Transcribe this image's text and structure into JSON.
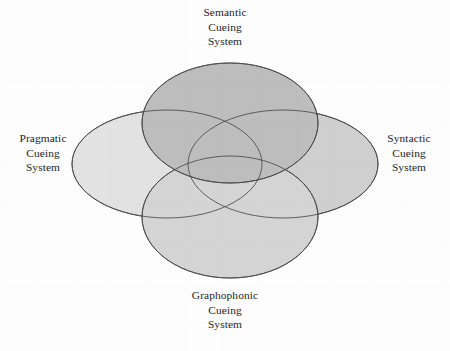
{
  "diagram": {
    "type": "venn",
    "background_color": "#fdfdfd",
    "stroke_color": "#4a4a4a",
    "sets": [
      {
        "id": "semantic",
        "label_lines": [
          "Semantic",
          "Cueing",
          "System"
        ],
        "label_line_1": "Semantic",
        "label_line_2": "Cueing",
        "label_line_3": "System",
        "position": "top",
        "fill_color": "#a9a9a9",
        "ellipse": {
          "cx": 230,
          "cy": 123,
          "rx": 88,
          "ry": 60
        }
      },
      {
        "id": "pragmatic",
        "label_lines": [
          "Pragmatic",
          "Cueing",
          "System"
        ],
        "label_line_1": "Pragmatic",
        "label_line_2": "Cueing",
        "label_line_3": "System",
        "position": "left",
        "fill_color": "#e2e2e2",
        "ellipse": {
          "cx": 167,
          "cy": 164,
          "rx": 95,
          "ry": 54
        }
      },
      {
        "id": "syntactic",
        "label_lines": [
          "Syntactic",
          "Cueing",
          "System"
        ],
        "label_line_1": "Syntactic",
        "label_line_2": "Cueing",
        "label_line_3": "System",
        "position": "right",
        "fill_color": "#c9c9c9",
        "ellipse": {
          "cx": 283,
          "cy": 164,
          "rx": 95,
          "ry": 54
        }
      },
      {
        "id": "graphophonic",
        "label_lines": [
          "Graphophonic",
          "Cueing",
          "System"
        ],
        "label_line_1": "Graphophonic",
        "label_line_2": "Cueing",
        "label_line_3": "System",
        "position": "bottom",
        "fill_color": "#cacaca",
        "ellipse": {
          "cx": 230,
          "cy": 217,
          "rx": 88,
          "ry": 61
        }
      }
    ]
  }
}
